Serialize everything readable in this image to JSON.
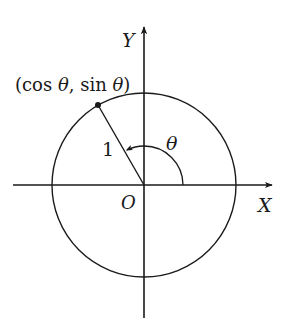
{
  "diagram": {
    "type": "unit-circle",
    "colors": {
      "stroke": "#1a1a1a",
      "background": "#ffffff"
    },
    "axes": {
      "x_label": "X",
      "y_label": "Y",
      "origin_label": "O"
    },
    "circle": {
      "radius_label": "1"
    },
    "angle": {
      "label": "θ",
      "degrees_depicted": 120
    },
    "point": {
      "label_open": "(cos ",
      "label_theta1": "θ",
      "label_mid": ", sin ",
      "label_theta2": "θ",
      "label_close": ")"
    }
  }
}
